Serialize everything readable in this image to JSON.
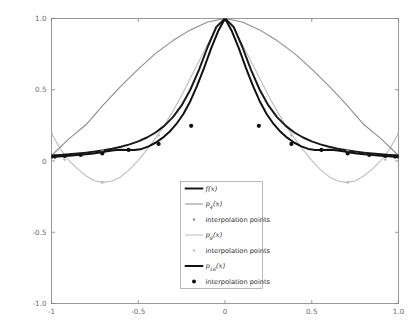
{
  "figure": {
    "background_color": "#ffffff",
    "axes_color": "#808080",
    "tick_label_color": "#6b6b6b",
    "legend_border_color": "#9a9a9a"
  },
  "axis": {
    "x_ticks": [
      "-1",
      "-0.5",
      "0",
      "0.5",
      "1.0"
    ],
    "x_tick_values": [
      -1,
      -0.5,
      0,
      0.5,
      1
    ],
    "y_ticks": [
      "1.0",
      "0.5",
      "0",
      "-0.5",
      "-1.0"
    ],
    "y_tick_values": [
      1,
      0.5,
      0,
      -0.5,
      -1
    ],
    "xlim": [
      -1,
      1
    ],
    "ylim": [
      -1,
      1
    ],
    "xlabel": "",
    "ylabel": "",
    "grid": false
  },
  "legend": {
    "position": "lower-center",
    "entries": [
      {
        "label_base": "f",
        "label_sub": "",
        "label_tail": "(x)",
        "type": "line",
        "color": "#1a1a1a",
        "width": 2.0,
        "marker": "none"
      },
      {
        "label_base": "p",
        "label_sub": "4",
        "label_tail": "(x)",
        "type": "line",
        "color": "#8c8c8c",
        "width": 1.1,
        "marker": "none"
      },
      {
        "label_base": "interpolation points",
        "label_sub": "",
        "label_tail": "",
        "type": "marker",
        "color": "#8c8c8c",
        "width": 0,
        "marker": "dot-small"
      },
      {
        "label_base": "p",
        "label_sub": "8",
        "label_tail": "(x)",
        "type": "line",
        "color": "#bdbdbd",
        "width": 1.1,
        "marker": "none"
      },
      {
        "label_base": "interpolation points",
        "label_sub": "",
        "label_tail": "",
        "type": "marker",
        "color": "#bdbdbd",
        "width": 0,
        "marker": "dot-small"
      },
      {
        "label_base": "p",
        "label_sub": "16",
        "label_tail": "(x)",
        "type": "line",
        "color": "#111111",
        "width": 2.0,
        "marker": "none"
      },
      {
        "label_base": "interpolation points",
        "label_sub": "",
        "label_tail": "",
        "type": "marker",
        "color": "#111111",
        "width": 0,
        "marker": "dot-large"
      }
    ]
  },
  "chart_data": {
    "type": "line",
    "title": "",
    "xlabel": "",
    "ylabel": "",
    "xlim": [
      -1,
      1
    ],
    "ylim": [
      -1,
      1
    ],
    "grid": false,
    "legend_position": "lower-center",
    "function_description": "Runge function f(x) = 1/(1+25x^2) with polynomial interpolants of degree 4, 8 and 16 at Chebyshev nodes",
    "series": [
      {
        "name": "f(x)",
        "type": "line",
        "color": "#1a1a1a",
        "width": 2.0,
        "formula": "1/(1+25*x^2)",
        "x": [
          -1,
          -0.95,
          -0.9,
          -0.85,
          -0.8,
          -0.75,
          -0.7,
          -0.65,
          -0.6,
          -0.55,
          -0.5,
          -0.45,
          -0.4,
          -0.35,
          -0.3,
          -0.25,
          -0.2,
          -0.15,
          -0.1,
          -0.05,
          0,
          0.05,
          0.1,
          0.15,
          0.2,
          0.25,
          0.3,
          0.35,
          0.4,
          0.45,
          0.5,
          0.55,
          0.6,
          0.65,
          0.7,
          0.75,
          0.8,
          0.85,
          0.9,
          0.95,
          1
        ],
        "y": [
          0.0385,
          0.0424,
          0.0471,
          0.0525,
          0.0588,
          0.0664,
          0.0754,
          0.0865,
          0.1,
          0.1167,
          0.1379,
          0.1649,
          0.2,
          0.2462,
          0.3077,
          0.3902,
          0.5,
          0.64,
          0.8,
          0.9412,
          1.0,
          0.9412,
          0.8,
          0.64,
          0.5,
          0.3902,
          0.3077,
          0.2462,
          0.2,
          0.1649,
          0.1379,
          0.1167,
          0.1,
          0.0865,
          0.0754,
          0.0664,
          0.0588,
          0.0525,
          0.0471,
          0.0424,
          0.0385
        ]
      },
      {
        "name": "p4(x)",
        "type": "line",
        "color": "#8c8c8c",
        "width": 1.1,
        "degree": 4,
        "x": [
          -1,
          -0.9,
          -0.8,
          -0.7,
          -0.6,
          -0.5,
          -0.4,
          -0.3,
          -0.2,
          -0.1,
          0,
          0.1,
          0.2,
          0.3,
          0.4,
          0.5,
          0.6,
          0.7,
          0.8,
          0.9,
          1
        ],
        "y": [
          0.0385,
          0.155,
          0.256,
          0.395,
          0.525,
          0.645,
          0.755,
          0.845,
          0.92,
          0.975,
          1.0,
          0.975,
          0.92,
          0.845,
          0.755,
          0.645,
          0.525,
          0.395,
          0.256,
          0.155,
          0.0385
        ]
      },
      {
        "name": "p8(x)",
        "type": "line",
        "color": "#bdbdbd",
        "width": 1.1,
        "degree": 8,
        "x": [
          -1,
          -0.95,
          -0.9,
          -0.85,
          -0.8,
          -0.75,
          -0.7,
          -0.65,
          -0.6,
          -0.55,
          -0.5,
          -0.45,
          -0.4,
          -0.35,
          -0.3,
          -0.25,
          -0.2,
          -0.15,
          -0.1,
          -0.05,
          0,
          0.05,
          0.1,
          0.15,
          0.2,
          0.25,
          0.3,
          0.35,
          0.4,
          0.45,
          0.5,
          0.55,
          0.6,
          0.65,
          0.7,
          0.75,
          0.8,
          0.85,
          0.9,
          0.95,
          1
        ],
        "y": [
          0.195,
          0.085,
          0.005,
          -0.055,
          -0.105,
          -0.14,
          -0.15,
          -0.14,
          -0.11,
          -0.06,
          0.005,
          0.08,
          0.16,
          0.25,
          0.35,
          0.46,
          0.58,
          0.7,
          0.82,
          0.93,
          1.0,
          0.93,
          0.82,
          0.7,
          0.58,
          0.46,
          0.35,
          0.25,
          0.16,
          0.08,
          0.005,
          -0.06,
          -0.11,
          -0.14,
          -0.15,
          -0.14,
          -0.105,
          -0.055,
          0.005,
          0.085,
          0.195
        ]
      },
      {
        "name": "p16(x)",
        "type": "line",
        "color": "#111111",
        "width": 2.0,
        "degree": 16,
        "x": [
          -1,
          -0.96,
          -0.92,
          -0.88,
          -0.84,
          -0.8,
          -0.76,
          -0.72,
          -0.68,
          -0.64,
          -0.6,
          -0.56,
          -0.52,
          -0.48,
          -0.44,
          -0.4,
          -0.36,
          -0.32,
          -0.28,
          -0.24,
          -0.2,
          -0.16,
          -0.12,
          -0.08,
          -0.04,
          0,
          0.04,
          0.08,
          0.12,
          0.16,
          0.2,
          0.24,
          0.28,
          0.32,
          0.36,
          0.4,
          0.44,
          0.48,
          0.52,
          0.56,
          0.6,
          0.64,
          0.68,
          0.72,
          0.76,
          0.8,
          0.84,
          0.88,
          0.92,
          0.96,
          1
        ],
        "y": [
          0.03,
          0.032,
          0.035,
          0.039,
          0.043,
          0.048,
          0.053,
          0.06,
          0.069,
          0.076,
          0.079,
          0.078,
          0.077,
          0.085,
          0.103,
          0.128,
          0.162,
          0.205,
          0.26,
          0.33,
          0.42,
          0.53,
          0.655,
          0.79,
          0.91,
          1.0,
          0.91,
          0.79,
          0.655,
          0.53,
          0.42,
          0.33,
          0.26,
          0.205,
          0.162,
          0.128,
          0.103,
          0.085,
          0.077,
          0.078,
          0.079,
          0.076,
          0.069,
          0.06,
          0.053,
          0.048,
          0.043,
          0.039,
          0.035,
          0.032,
          0.03
        ]
      }
    ],
    "markers": [
      {
        "name": "interpolation points p4",
        "color": "#8c8c8c",
        "size": 1.4,
        "x": [
          -1,
          -0.7071,
          0,
          0.7071,
          1
        ],
        "y": [
          0.0385,
          0.0748,
          1.0,
          0.0748,
          0.0385
        ]
      },
      {
        "name": "interpolation points p8",
        "color": "#bdbdbd",
        "size": 1.4,
        "x": [
          -1,
          -0.9239,
          -0.7071,
          -0.3827,
          0,
          0.3827,
          0.7071,
          0.9239,
          1
        ],
        "y": [
          0.195,
          0.01,
          -0.15,
          0.18,
          1.0,
          0.18,
          -0.15,
          0.01,
          0.195
        ]
      },
      {
        "name": "interpolation points p16",
        "color": "#111111",
        "size": 2.1,
        "x": [
          -1,
          -0.9808,
          -0.9239,
          -0.8315,
          -0.7071,
          -0.5556,
          -0.3827,
          -0.1951,
          0,
          0.1951,
          0.3827,
          0.5556,
          0.7071,
          0.8315,
          0.9239,
          0.9808,
          1
        ],
        "y": [
          0.03,
          0.031,
          0.035,
          0.042,
          0.0535,
          0.078,
          0.12,
          0.247,
          1.0,
          0.247,
          0.12,
          0.078,
          0.0535,
          0.042,
          0.035,
          0.031,
          0.03
        ]
      }
    ]
  }
}
